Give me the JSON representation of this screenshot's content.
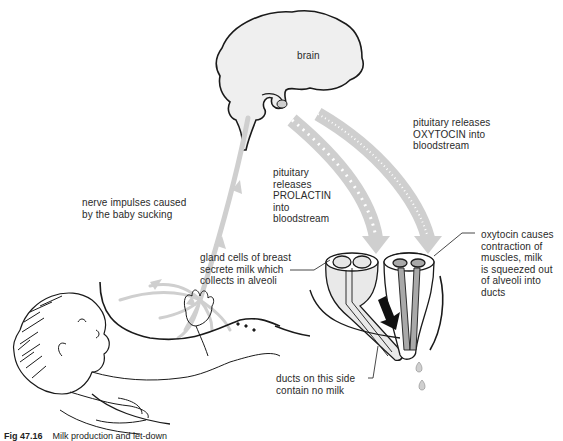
{
  "diagram": {
    "labels": {
      "brain": "brain",
      "oxytocin_release": "pituitary releases\nOXYTOCIN into\nbloodstream",
      "prolactin_release": "pituitary\nreleases\nPROLACTIN\ninto\nbloodstream",
      "nerve_impulses": "nerve impulses caused\nby the baby sucking",
      "gland_cells": "gland cells of breast\nsecrete milk which\ncollects in alveoli",
      "oxytocin_effect": "oxytocin causes\ncontraction of\nmuscles, milk\nis squeezed out\nof  alveoli into\nducts",
      "ducts_no_milk": "ducts on this side\ncontain no milk"
    },
    "caption": {
      "figure_number": "Fig 47.16",
      "text": "Milk production and let-down"
    },
    "colors": {
      "line": "#1a1a1a",
      "arrow_fill": "#cfcfcf",
      "brain_fill": "#efefef",
      "duct_fill": "#a9a9a9",
      "text": "#2a2a2a"
    }
  }
}
